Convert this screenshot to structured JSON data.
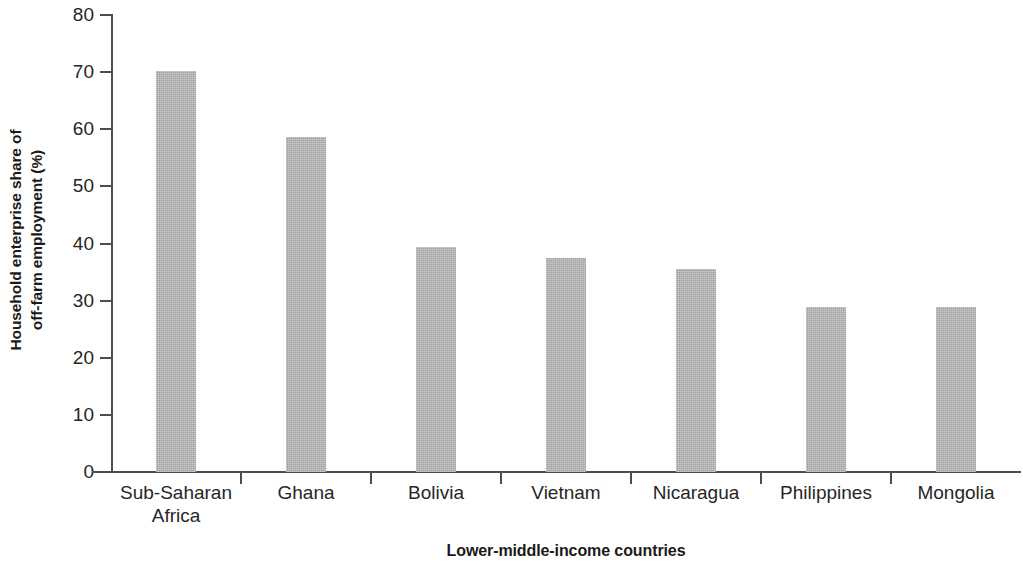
{
  "chart_data": {
    "type": "bar",
    "title": "",
    "subtitle": "",
    "xlabel": "Lower-middle-income countries",
    "ylabel": "Household enterprise share of off-farm employment (%)",
    "ylabel_lines": [
      "Household enterprise share of",
      "off-farm employment (%)"
    ],
    "categories": [
      "Sub-Saharan Africa",
      "Ghana",
      "Bolivia",
      "Vietnam",
      "Nicaragua",
      "Philippines",
      "Mongolia"
    ],
    "category_label_lines": [
      [
        "Sub-Saharan",
        "Africa"
      ],
      [
        "Ghana"
      ],
      [
        "Bolivia"
      ],
      [
        "Vietnam"
      ],
      [
        "Nicaragua"
      ],
      [
        "Philippines"
      ],
      [
        "Mongolia"
      ]
    ],
    "values": [
      70.2,
      58.7,
      39.4,
      37.5,
      35.6,
      28.8,
      28.8
    ],
    "ylim": [
      0,
      80
    ],
    "ytick_values": [
      0,
      10,
      20,
      30,
      40,
      50,
      60,
      70,
      80
    ],
    "ytick_labels": [
      "0",
      "10",
      "20",
      "30",
      "40",
      "50",
      "60",
      "70",
      "80"
    ],
    "grid": false,
    "legend": false,
    "legend_position": "none",
    "bar_color": "#b3b3b3",
    "axis_color": "#4d4d4d",
    "text_color": "#262626",
    "background_color": "#ffffff"
  }
}
